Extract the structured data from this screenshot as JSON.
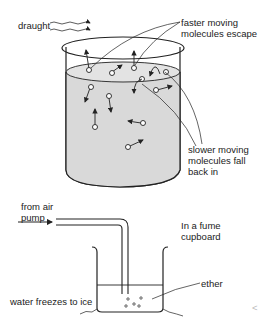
{
  "top_diagram": {
    "labels": {
      "draught": "draught",
      "faster_1": "faster moving",
      "faster_2": "molecules escape",
      "slower_1": "slower moving",
      "slower_2": "molecules fall",
      "slower_3": "back in"
    }
  },
  "bottom_diagram": {
    "labels": {
      "from_air_1": "from air",
      "from_air_2": "pump",
      "fume_1": "In a fume",
      "fume_2": "cupboard",
      "ether": "ether",
      "water_ice": "water freezes to ice"
    }
  },
  "colors": {
    "liquid_fill": "#d9d9d9",
    "line": "#222222"
  },
  "page_nav": {
    "prev_glyph": "<"
  }
}
